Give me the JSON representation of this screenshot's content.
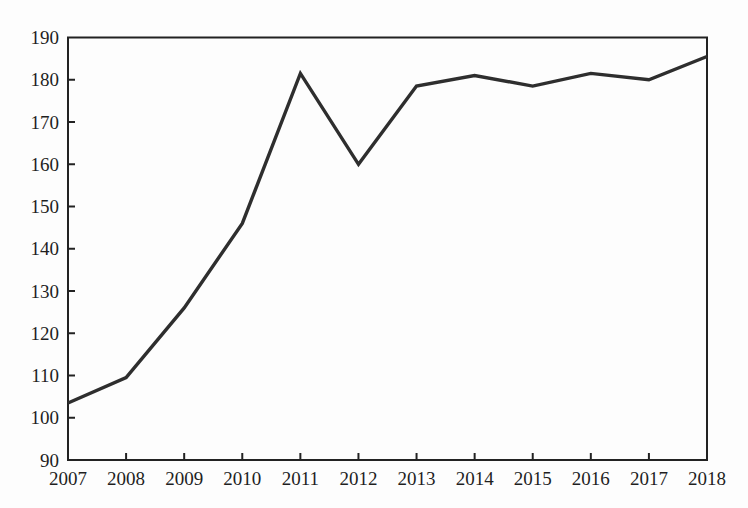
{
  "figure": {
    "title": "",
    "accessible_name": "Line chart showing a value rising from about 103.5 in 2007 to a peak of 181.5 in 2011, dipping to 160 in 2012, then levelling off around 178-185 through 2018"
  },
  "chart_data": {
    "type": "line",
    "categories": [
      "2007",
      "2008",
      "2009",
      "2010",
      "2011",
      "2012",
      "2013",
      "2014",
      "2015",
      "2016",
      "2017",
      "2018"
    ],
    "values": [
      103.5,
      109.5,
      126,
      146,
      181.5,
      160,
      178.5,
      181,
      178.5,
      181.5,
      180,
      185.5
    ],
    "series": [
      {
        "name": "value",
        "values": [
          103.5,
          109.5,
          126,
          146,
          181.5,
          160,
          178.5,
          181,
          178.5,
          181.5,
          180,
          185.5
        ]
      }
    ],
    "title": "",
    "xlabel": "",
    "ylabel": "",
    "ylim": [
      90,
      190
    ],
    "xlim_categories": [
      "2007",
      "2018"
    ],
    "ytick_step": 10,
    "yticks": [
      90,
      100,
      110,
      120,
      130,
      140,
      150,
      160,
      170,
      180,
      190
    ],
    "grid": false,
    "legend": "none",
    "frame": "box",
    "tick_direction": "in",
    "line_color": "#2e2e2e",
    "axis_color": "#222222",
    "label_color": "#1f1f1f",
    "background_color": "#fdfdfd"
  }
}
